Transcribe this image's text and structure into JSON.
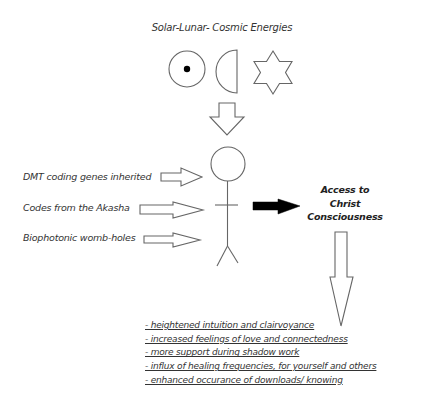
{
  "diagram": {
    "title": "Solar-Lunar- Cosmic Energies",
    "energy_symbols": [
      {
        "name": "sun",
        "icon": "circle-dot-icon"
      },
      {
        "name": "moon",
        "icon": "half-moon-icon"
      },
      {
        "name": "star",
        "icon": "six-point-star-icon"
      }
    ],
    "inputs": [
      {
        "label": "DMT coding genes inherited"
      },
      {
        "label": "Codes from the Akasha"
      },
      {
        "label": "Biophotonic womb-holes"
      }
    ],
    "figure": "stick-figure-person",
    "result": {
      "line1": "Access to",
      "line2": "Christ",
      "line3": "Consciousness"
    },
    "benefits": [
      "- heightened intuition and clairvoyance",
      "- increased feelings of love and connectedness",
      "- more support during shadow work",
      "- influx of healing frequencies, for yourself and others",
      "- enhanced occurance of downloads/ knowing"
    ],
    "colors": {
      "stroke": "#555555",
      "arrow_fill_dark": "#000000",
      "background": "#ffffff",
      "text": "#333333"
    }
  }
}
